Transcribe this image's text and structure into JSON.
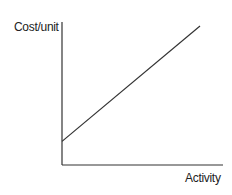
{
  "chart_data": {
    "type": "line",
    "title": "",
    "xlabel": "Activity",
    "ylabel": "Cost/unit",
    "x": [
      0,
      1
    ],
    "series": [
      {
        "name": "Cost/unit",
        "values": [
          0.17,
          1.0
        ]
      }
    ],
    "xlim": [
      0,
      1
    ],
    "ylim": [
      0,
      1
    ],
    "grid": false,
    "legend": "none",
    "ticks": "none",
    "annotations": [],
    "colors": {
      "axis": "#333333",
      "line": "#333333",
      "text": "#222222"
    }
  }
}
